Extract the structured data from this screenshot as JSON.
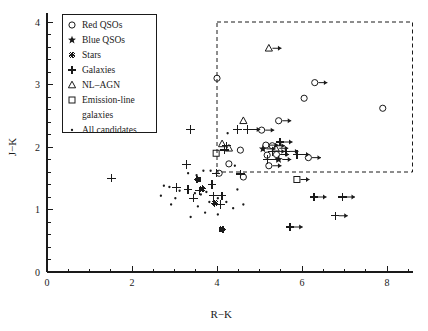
{
  "figure": {
    "background": "#ffffff",
    "foreground": "#1a1a1a"
  },
  "axes": {
    "xlabel": "R−K",
    "ylabel": "J−K",
    "x_ticks": [
      "0",
      "2",
      "4",
      "6",
      "8"
    ],
    "y_ticks": [
      "0",
      "1",
      "2",
      "3",
      "4"
    ]
  },
  "legend": {
    "items": [
      {
        "label": "Red QSOs",
        "marker": "open-circle-icon"
      },
      {
        "label": "Blue QSOs",
        "marker": "filled-star-icon"
      },
      {
        "label": "Stars",
        "marker": "asterisk-icon"
      },
      {
        "label": "Galaxies",
        "marker": "plus-icon"
      },
      {
        "label": "NL–AGN",
        "marker": "open-triangle-icon"
      },
      {
        "label": "Emission-line",
        "label2": "galaxies",
        "marker": "open-square-icon"
      },
      {
        "label": "All candidates",
        "marker": "small-dot-icon"
      }
    ]
  },
  "chart_data": {
    "type": "scatter",
    "title": "",
    "xlabel": "R−K",
    "ylabel": "J−K",
    "xlim": [
      0,
      8.6
    ],
    "ylim": [
      0,
      4.15
    ],
    "x_ticks": [
      0,
      2,
      4,
      6,
      8
    ],
    "y_ticks": [
      0,
      1,
      2,
      3,
      4
    ],
    "grid": false,
    "legend_position": "top-left",
    "minor_ticks": true,
    "selection_box": {
      "x_min": 4.0,
      "x_max": 8.65,
      "y_min": 1.6,
      "y_max": 4.0,
      "style": "dashed",
      "note": "red-object selection region"
    },
    "series": [
      {
        "name": "Red QSOs",
        "marker": "open-circle",
        "points": [
          {
            "x": 4.0,
            "y": 3.1
          },
          {
            "x": 6.3,
            "y": 3.03,
            "limit": "x-lower"
          },
          {
            "x": 6.05,
            "y": 2.78
          },
          {
            "x": 7.9,
            "y": 2.62
          },
          {
            "x": 5.45,
            "y": 2.42,
            "limit": "x-lower"
          },
          {
            "x": 5.05,
            "y": 2.27,
            "limit": "x-lower"
          },
          {
            "x": 4.55,
            "y": 1.95
          },
          {
            "x": 5.3,
            "y": 2.02,
            "limit": "x-lower"
          },
          {
            "x": 5.15,
            "y": 2.03,
            "limit": "x-lower"
          },
          {
            "x": 5.4,
            "y": 1.88,
            "limit": "x-lower"
          },
          {
            "x": 6.15,
            "y": 1.83,
            "limit": "x-lower"
          },
          {
            "x": 5.18,
            "y": 1.87
          },
          {
            "x": 4.28,
            "y": 1.73
          },
          {
            "x": 5.22,
            "y": 1.7,
            "limit": "x-lower"
          },
          {
            "x": 4.05,
            "y": 1.58
          },
          {
            "x": 4.62,
            "y": 1.52
          }
        ]
      },
      {
        "name": "Blue QSOs",
        "marker": "filled-star",
        "points": [
          {
            "x": 5.45,
            "y": 1.8,
            "limit": "x-lower"
          },
          {
            "x": 5.08,
            "y": 1.97,
            "limit": "x-lower"
          }
        ]
      },
      {
        "name": "Stars",
        "marker": "asterisk",
        "points": [
          {
            "x": 3.65,
            "y": 1.33
          },
          {
            "x": 3.95,
            "y": 1.1
          },
          {
            "x": 4.12,
            "y": 0.68
          },
          {
            "x": 3.55,
            "y": 1.48
          }
        ]
      },
      {
        "name": "Galaxies",
        "marker": "plus",
        "points": [
          {
            "x": 1.52,
            "y": 1.5
          },
          {
            "x": 3.38,
            "y": 2.28
          },
          {
            "x": 4.48,
            "y": 2.28
          },
          {
            "x": 3.28,
            "y": 1.72
          },
          {
            "x": 4.18,
            "y": 1.95
          },
          {
            "x": 4.22,
            "y": 2.02
          },
          {
            "x": 3.05,
            "y": 1.35
          },
          {
            "x": 3.32,
            "y": 1.32
          },
          {
            "x": 3.58,
            "y": 1.3
          },
          {
            "x": 3.88,
            "y": 1.4
          },
          {
            "x": 3.92,
            "y": 1.22
          },
          {
            "x": 4.12,
            "y": 1.22
          },
          {
            "x": 4.55,
            "y": 1.57
          },
          {
            "x": 5.3,
            "y": 1.93,
            "limit": "x-lower"
          },
          {
            "x": 5.62,
            "y": 1.93,
            "limit": "x-lower"
          },
          {
            "x": 5.88,
            "y": 1.88,
            "limit": "x-lower"
          },
          {
            "x": 5.18,
            "y": 1.8,
            "limit": "x-lower"
          },
          {
            "x": 5.48,
            "y": 2.08,
            "limit": "x-lower"
          },
          {
            "x": 4.72,
            "y": 2.28,
            "limit": "x-lower"
          },
          {
            "x": 3.45,
            "y": 1.18
          },
          {
            "x": 3.98,
            "y": 1.58
          },
          {
            "x": 6.28,
            "y": 1.2,
            "limit": "x-lower"
          },
          {
            "x": 6.95,
            "y": 1.2,
            "limit": "x-lower"
          },
          {
            "x": 6.78,
            "y": 0.9,
            "limit": "x-lower"
          },
          {
            "x": 5.72,
            "y": 0.72,
            "limit": "x-lower"
          },
          {
            "x": 4.08,
            "y": 1.08
          }
        ]
      },
      {
        "name": "NL-AGN",
        "marker": "open-triangle",
        "points": [
          {
            "x": 5.22,
            "y": 3.58,
            "limit": "x-lower"
          },
          {
            "x": 4.62,
            "y": 2.42
          },
          {
            "x": 4.12,
            "y": 2.05
          },
          {
            "x": 4.28,
            "y": 1.98
          },
          {
            "x": 5.38,
            "y": 1.98,
            "limit": "x-lower"
          }
        ]
      },
      {
        "name": "Emission-line galaxies",
        "marker": "open-square",
        "points": [
          {
            "x": 5.88,
            "y": 1.48,
            "limit": "x-lower"
          },
          {
            "x": 3.98,
            "y": 1.9
          }
        ]
      },
      {
        "name": "All candidates",
        "marker": "small-dot",
        "points": [
          {
            "x": 2.75,
            "y": 1.38
          },
          {
            "x": 2.88,
            "y": 1.36
          },
          {
            "x": 3.12,
            "y": 1.3
          },
          {
            "x": 3.48,
            "y": 1.26
          },
          {
            "x": 3.62,
            "y": 1.24
          },
          {
            "x": 3.75,
            "y": 1.28
          },
          {
            "x": 3.82,
            "y": 1.12
          },
          {
            "x": 4.02,
            "y": 1.18
          },
          {
            "x": 4.22,
            "y": 1.12
          },
          {
            "x": 4.38,
            "y": 1.02
          },
          {
            "x": 3.55,
            "y": 1.05
          },
          {
            "x": 3.72,
            "y": 0.95
          },
          {
            "x": 2.92,
            "y": 1.08
          },
          {
            "x": 3.38,
            "y": 0.88
          },
          {
            "x": 4.02,
            "y": 0.92
          },
          {
            "x": 3.68,
            "y": 1.62
          },
          {
            "x": 3.52,
            "y": 1.55
          },
          {
            "x": 3.85,
            "y": 1.62
          },
          {
            "x": 3.32,
            "y": 1.58
          },
          {
            "x": 4.42,
            "y": 1.7
          },
          {
            "x": 4.48,
            "y": 1.32
          },
          {
            "x": 3.02,
            "y": 1.18
          },
          {
            "x": 4.62,
            "y": 1.08
          },
          {
            "x": 2.68,
            "y": 1.22
          },
          {
            "x": 4.25,
            "y": 2.22
          }
        ]
      }
    ]
  }
}
